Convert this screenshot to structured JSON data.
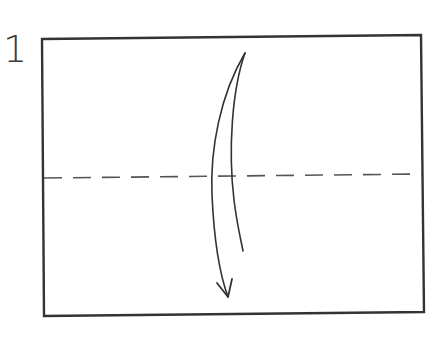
{
  "step": {
    "number": "1"
  },
  "diagram": {
    "paper": {
      "shape": "rectangle",
      "stroke": "#333333"
    },
    "fold_line": {
      "type": "valley",
      "style": "dashed",
      "color": "#555555"
    },
    "arrow": {
      "type": "valley-fold-arrow",
      "direction": "down",
      "color": "#333333"
    }
  }
}
